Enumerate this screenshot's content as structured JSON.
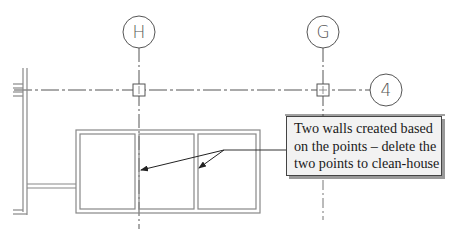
{
  "diagram": {
    "grid_bubbles": [
      {
        "label": "H",
        "cx": 139,
        "cy": 32,
        "r": 16
      },
      {
        "label": "G",
        "cx": 323,
        "cy": 32,
        "r": 16
      },
      {
        "label": "4",
        "cx": 386,
        "cy": 90,
        "r": 16
      }
    ],
    "points": [
      {
        "name": "point-H4",
        "x": 139,
        "y": 90
      },
      {
        "name": "point-G4",
        "x": 323,
        "y": 90
      }
    ],
    "callout": {
      "lines": [
        "Two walls created based",
        "on the points – delete the",
        "two points to clean-house"
      ]
    },
    "colors": {
      "line": "#555555",
      "text": "#1a1a1a",
      "callout_bg": "#f2f2f2"
    }
  }
}
